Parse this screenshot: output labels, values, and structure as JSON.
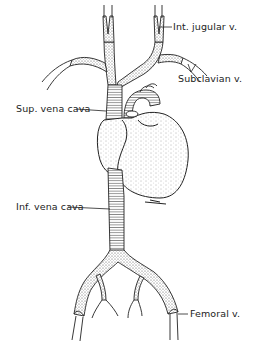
{
  "diagram": {
    "type": "anatomical-line-drawing",
    "colors": {
      "ink": "#222222",
      "background": "#ffffff",
      "stipple": "#555555"
    },
    "labels": [
      {
        "id": "int-jugular",
        "text": "Int. jugular v."
      },
      {
        "id": "subclavian",
        "text": "Subclavian v."
      },
      {
        "id": "sup-vena-cava",
        "text": "Sup. vena cava"
      },
      {
        "id": "inf-vena-cava",
        "text": "Inf. vena cava"
      },
      {
        "id": "femoral",
        "text": "Femoral v."
      }
    ]
  }
}
